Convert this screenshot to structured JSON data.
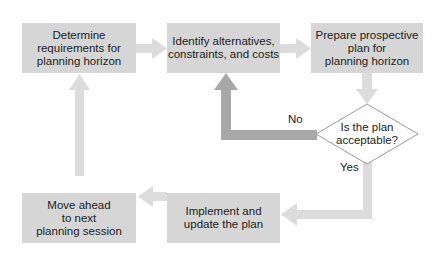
{
  "diagram": {
    "nodes": [
      {
        "id": "determine",
        "label": "Determine requirements for planning horizon",
        "lines": [
          "Determine",
          "requirements for",
          "planning horizon"
        ]
      },
      {
        "id": "identify",
        "label": "Identify alternatives, constraints, and costs",
        "lines": [
          "Identify alternatives,",
          "constraints, and costs"
        ]
      },
      {
        "id": "prepare",
        "label": "Prepare prospective plan for planning horizon",
        "lines": [
          "Prepare prospective",
          "plan for",
          "planning horizon"
        ]
      },
      {
        "id": "decision",
        "label": "Is the plan acceptable?",
        "lines": [
          "Is the plan",
          "acceptable?"
        ]
      },
      {
        "id": "implement",
        "label": "Implement and update the plan",
        "lines": [
          "Implement and",
          "update the plan"
        ]
      },
      {
        "id": "move",
        "label": "Move ahead to next planning session",
        "lines": [
          "Move ahead",
          "to next",
          "planning session"
        ]
      }
    ],
    "edges": [
      {
        "from": "determine",
        "to": "identify",
        "label": ""
      },
      {
        "from": "identify",
        "to": "prepare",
        "label": ""
      },
      {
        "from": "prepare",
        "to": "decision",
        "label": ""
      },
      {
        "from": "decision",
        "to": "identify",
        "label": "No"
      },
      {
        "from": "decision",
        "to": "implement",
        "label": "Yes"
      },
      {
        "from": "implement",
        "to": "move",
        "label": ""
      },
      {
        "from": "move",
        "to": "determine",
        "label": ""
      }
    ],
    "edge_labels": {
      "no": "No",
      "yes": "Yes"
    },
    "colors": {
      "box": "#d6d6d6",
      "arrow_light": "#dcdcdc",
      "arrow_dark": "#a8a8a8",
      "diamond_border": "#9a9a9a"
    }
  }
}
